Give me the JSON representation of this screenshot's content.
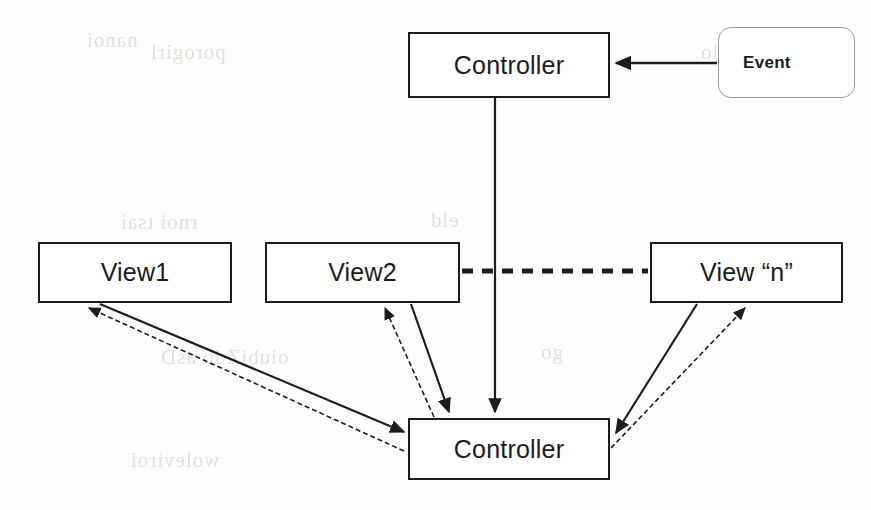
{
  "diagram": {
    "type": "block-diagram",
    "width": 871,
    "height": 510,
    "background_color": "#fdfdfc",
    "stroke_color": "#1c1c1c",
    "soft_stroke_color": "#9a9a9a",
    "nodes": [
      {
        "id": "controller-top",
        "label": "Controller",
        "shape": "rectangle",
        "x": 408,
        "y": 32,
        "w": 202,
        "h": 66
      },
      {
        "id": "event",
        "label": "Event",
        "shape": "rounded-rectangle",
        "x": 718,
        "y": 27,
        "w": 137,
        "h": 71
      },
      {
        "id": "view1",
        "label": "View1",
        "shape": "rectangle",
        "x": 38,
        "y": 242,
        "w": 194,
        "h": 61
      },
      {
        "id": "view2",
        "label": "View2",
        "shape": "rectangle",
        "x": 265,
        "y": 242,
        "w": 195,
        "h": 61
      },
      {
        "id": "viewn",
        "label": "View “n”",
        "shape": "rectangle",
        "x": 650,
        "y": 242,
        "w": 193,
        "h": 61
      },
      {
        "id": "controller-bottom",
        "label": "Controller",
        "shape": "rectangle",
        "x": 408,
        "y": 418,
        "w": 202,
        "h": 62
      }
    ],
    "edges": [
      {
        "id": "event-to-controller-top",
        "from": "event",
        "to": "controller-top",
        "style": "solid",
        "arrow": "end"
      },
      {
        "id": "controller-top-to-controller-bottom",
        "from": "controller-top",
        "to": "controller-bottom",
        "style": "solid",
        "arrow": "end"
      },
      {
        "id": "view2-to-viewn-ellipsis",
        "from": "view2",
        "to": "viewn",
        "style": "dashed",
        "arrow": "none"
      },
      {
        "id": "view1-to-controller-bottom",
        "from": "view1",
        "to": "controller-bottom",
        "style": "solid",
        "arrow": "end"
      },
      {
        "id": "controller-bottom-to-view1",
        "from": "controller-bottom",
        "to": "view1",
        "style": "dashed",
        "arrow": "end"
      },
      {
        "id": "view2-to-controller-bottom",
        "from": "view2",
        "to": "controller-bottom",
        "style": "solid",
        "arrow": "end"
      },
      {
        "id": "controller-bottom-to-view2",
        "from": "controller-bottom",
        "to": "view2",
        "style": "dashed",
        "arrow": "end"
      },
      {
        "id": "viewn-to-controller-bottom",
        "from": "viewn",
        "to": "controller-bottom",
        "style": "solid",
        "arrow": "end"
      },
      {
        "id": "controller-bottom-to-viewn",
        "from": "controller-bottom",
        "to": "viewn",
        "style": "dashed",
        "arrow": "end"
      }
    ],
    "background_artifacts": [
      {
        "id": "bleed-1",
        "x": 86,
        "y": 28,
        "text": "nanoi"
      },
      {
        "id": "bleed-2",
        "x": 150,
        "y": 40,
        "text": "porogirl"
      },
      {
        "id": "bleed-3",
        "x": 430,
        "y": 38,
        "text": "boroq"
      },
      {
        "id": "bleed-4",
        "x": 700,
        "y": 40,
        "text": "lo"
      },
      {
        "id": "bleed-5",
        "x": 120,
        "y": 210,
        "text": "rnoi tsai"
      },
      {
        "id": "bleed-6",
        "x": 430,
        "y": 208,
        "text": "eld"
      },
      {
        "id": "bleed-7",
        "x": 160,
        "y": 345,
        "text": "oiubiZ lo asD"
      },
      {
        "id": "bleed-8",
        "x": 540,
        "y": 340,
        "text": "go"
      },
      {
        "id": "bleed-9",
        "x": 130,
        "y": 448,
        "text": "woleviroi"
      },
      {
        "id": "bleed-10",
        "x": 470,
        "y": 452,
        "text": "iois"
      }
    ]
  }
}
